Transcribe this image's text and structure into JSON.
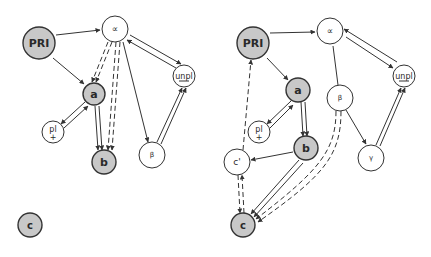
{
  "colors": {
    "background": "#ffffff",
    "stroke": "#333333",
    "filled_node": "#c8c8c8",
    "empty_node": "#ffffff",
    "text": "#2a2a2a"
  },
  "diagrams": [
    {
      "id": "left",
      "nodes": [
        {
          "id": "PRI",
          "label": "PRI",
          "x": 39,
          "y": 43,
          "r": 16,
          "filled": true,
          "bold": true,
          "size": 11
        },
        {
          "id": "alpha",
          "label": "∝",
          "x": 115,
          "y": 29,
          "r": 13,
          "filled": false,
          "bold": false,
          "size": 9
        },
        {
          "id": "a",
          "label": "a",
          "x": 94,
          "y": 94,
          "r": 11,
          "filled": true,
          "bold": true,
          "size": 11
        },
        {
          "id": "unpl",
          "label": "unpl",
          "x": 184,
          "y": 76,
          "r": 11,
          "filled": false,
          "bold": false,
          "size": 8,
          "underline": true
        },
        {
          "id": "pl",
          "label": "pl",
          "sublabel": "+",
          "x": 53,
          "y": 132,
          "r": 11,
          "filled": false,
          "bold": false,
          "size": 8
        },
        {
          "id": "b",
          "label": "b",
          "x": 104,
          "y": 162,
          "r": 12,
          "filled": true,
          "bold": true,
          "size": 11
        },
        {
          "id": "beta",
          "label": "β",
          "x": 152,
          "y": 155,
          "r": 13,
          "filled": false,
          "bold": false,
          "size": 7
        },
        {
          "id": "c",
          "label": "c",
          "x": 30,
          "y": 225,
          "r": 12,
          "filled": true,
          "bold": true,
          "size": 10
        }
      ],
      "edges": [
        {
          "from": [
            56,
            35
          ],
          "to": [
            100,
            30
          ],
          "style": "solid",
          "arrow": "end"
        },
        {
          "from": [
            53,
            58
          ],
          "to": [
            84,
            84
          ],
          "style": "solid",
          "arrow": "end"
        },
        {
          "from": [
            130,
            35
          ],
          "to": [
            181,
            64
          ],
          "style": "solid",
          "arrow": "end"
        },
        {
          "from": [
            176,
            68
          ],
          "to": [
            127,
            40
          ],
          "style": "solid",
          "arrow": "start-line"
        },
        {
          "from": [
            108,
            42
          ],
          "to": [
            92,
            82
          ],
          "style": "dashed",
          "arrow": "end"
        },
        {
          "from": [
            112,
            42
          ],
          "to": [
            96,
            82
          ],
          "style": "dashed",
          "arrow": "end"
        },
        {
          "from": [
            116,
            42
          ],
          "to": [
            108,
            150
          ],
          "style": "dashed",
          "arrow": "end"
        },
        {
          "from": [
            120,
            42
          ],
          "to": [
            112,
            150
          ],
          "style": "dashed",
          "arrow": "end"
        },
        {
          "from": [
            123,
            42
          ],
          "to": [
            148,
            142
          ],
          "style": "solid",
          "arrow": "end"
        },
        {
          "from": [
            95,
            106
          ],
          "to": [
            98,
            150
          ],
          "style": "solid",
          "arrow": "end"
        },
        {
          "from": [
            99,
            106
          ],
          "to": [
            102,
            150
          ],
          "style": "solid",
          "arrow": "end"
        },
        {
          "from": [
            85,
            102
          ],
          "to": [
            61,
            124
          ],
          "style": "solid",
          "arrow": "end"
        },
        {
          "from": [
            64,
            128
          ],
          "to": [
            88,
            106
          ],
          "style": "solid",
          "arrow": "end"
        },
        {
          "from": [
            157,
            142
          ],
          "to": [
            182,
            88
          ],
          "style": "solid",
          "arrow": "end"
        },
        {
          "from": [
            161,
            144
          ],
          "to": [
            186,
            88
          ],
          "style": "solid",
          "arrow": "end"
        }
      ]
    },
    {
      "id": "right",
      "nodes": [
        {
          "id": "PRI",
          "label": "PRI",
          "x": 253,
          "y": 43,
          "r": 16,
          "filled": true,
          "bold": true,
          "size": 11
        },
        {
          "id": "alpha",
          "label": "∝",
          "x": 330,
          "y": 31,
          "r": 13,
          "filled": false,
          "bold": false,
          "size": 9
        },
        {
          "id": "a",
          "label": "a",
          "x": 298,
          "y": 90,
          "r": 12,
          "filled": true,
          "bold": true,
          "size": 11
        },
        {
          "id": "unpl",
          "label": "unpl",
          "x": 404,
          "y": 76,
          "r": 11,
          "filled": false,
          "bold": false,
          "size": 8,
          "underline": true
        },
        {
          "id": "beta",
          "label": "β",
          "x": 340,
          "y": 98,
          "r": 13,
          "filled": false,
          "bold": false,
          "size": 7
        },
        {
          "id": "pl",
          "label": "pl",
          "sublabel": "+",
          "x": 259,
          "y": 132,
          "r": 11,
          "filled": false,
          "bold": false,
          "size": 8
        },
        {
          "id": "b",
          "label": "b",
          "x": 306,
          "y": 148,
          "r": 12,
          "filled": true,
          "bold": true,
          "size": 11
        },
        {
          "id": "gamma",
          "label": "γ",
          "x": 371,
          "y": 158,
          "r": 13,
          "filled": false,
          "bold": false,
          "size": 7
        },
        {
          "id": "cprime",
          "label": "c'",
          "x": 237,
          "y": 162,
          "r": 13,
          "filled": false,
          "bold": false,
          "size": 9
        },
        {
          "id": "c",
          "label": "c",
          "x": 243,
          "y": 225,
          "r": 12,
          "filled": true,
          "bold": true,
          "size": 10
        }
      ],
      "edges": [
        {
          "from": [
            270,
            33
          ],
          "to": [
            315,
            32
          ],
          "style": "solid",
          "arrow": "end"
        },
        {
          "from": [
            267,
            58
          ],
          "to": [
            288,
            80
          ],
          "style": "solid",
          "arrow": "end"
        },
        {
          "from": [
            346,
            37
          ],
          "to": [
            393,
            68
          ],
          "style": "solid",
          "arrow": "end"
        },
        {
          "from": [
            397,
            62
          ],
          "to": [
            344,
            29
          ],
          "style": "solid",
          "arrow": "end"
        },
        {
          "from": [
            333,
            46
          ],
          "to": [
            338,
            85
          ],
          "style": "solid",
          "arrow": "none"
        },
        {
          "from": [
            291,
            101
          ],
          "to": [
            267,
            124
          ],
          "style": "solid",
          "arrow": "end"
        },
        {
          "from": [
            270,
            128
          ],
          "to": [
            293,
            105
          ],
          "style": "solid",
          "arrow": "end"
        },
        {
          "from": [
            301,
            102
          ],
          "to": [
            303,
            136
          ],
          "style": "solid",
          "arrow": "end"
        },
        {
          "from": [
            305,
            102
          ],
          "to": [
            307,
            136
          ],
          "style": "solid",
          "arrow": "end"
        },
        {
          "from": [
            293,
            152
          ],
          "to": [
            251,
            160
          ],
          "style": "solid",
          "arrow": "end"
        },
        {
          "from": [
            243,
            150
          ],
          "to": [
            251,
            60
          ],
          "style": "dashed",
          "arrow": "end"
        },
        {
          "from": [
            346,
            110
          ],
          "to": [
            366,
            144
          ],
          "style": "solid",
          "arrow": "end"
        },
        {
          "from": [
            376,
            145
          ],
          "to": [
            401,
            88
          ],
          "style": "solid",
          "arrow": "end"
        },
        {
          "from": [
            380,
            146
          ],
          "to": [
            405,
            88
          ],
          "style": "solid",
          "arrow": "end"
        },
        {
          "from": [
            299,
            160
          ],
          "to": [
            251,
            214
          ],
          "style": "solid",
          "arrow": "end"
        },
        {
          "from": [
            303,
            163
          ],
          "to": [
            254,
            217
          ],
          "style": "solid",
          "arrow": "end"
        },
        {
          "from": [
            238,
            175
          ],
          "to": [
            240,
            213
          ],
          "style": "dashed",
          "arrow": "end"
        },
        {
          "from": [
            244,
            213
          ],
          "to": [
            242,
            175
          ],
          "style": "dashed",
          "arrow": "end"
        }
      ],
      "curves": [
        {
          "d": "M 336 111 C 336 150, 320 170, 256 219",
          "style": "dashed",
          "arrow": "end"
        },
        {
          "d": "M 341 111 C 341 155, 325 175, 258 222",
          "style": "dashed",
          "arrow": "end"
        }
      ]
    }
  ]
}
